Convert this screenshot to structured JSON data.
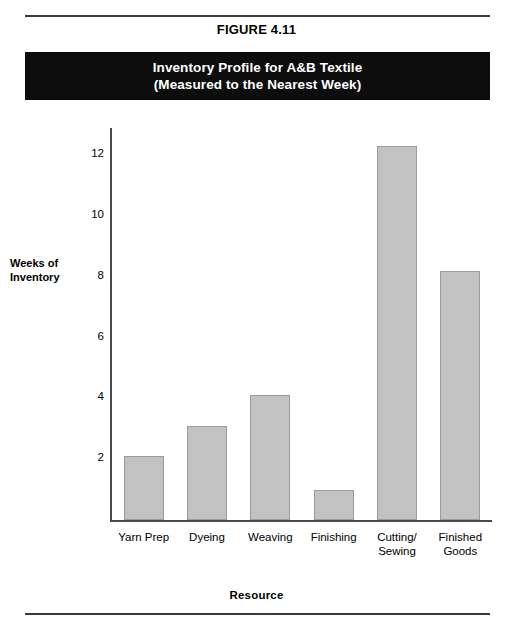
{
  "figure": {
    "number": "FIGURE 4.11",
    "title_line_1": "Inventory Profile for A&B Textile",
    "title_line_2": "(Measured to the Nearest Week)"
  },
  "colors": {
    "bar_fill": "#c2c2c2",
    "bar_stroke": "#9b9b9b",
    "banner_bg": "#0d0d0d",
    "banner_text": "#ffffff",
    "axis": "#4a4a4a",
    "rule": "#3a3a3a"
  },
  "chart_data": {
    "type": "bar",
    "title": "Inventory Profile for A&B Textile (Measured to the Nearest Week)",
    "xlabel": "Resource",
    "ylabel": "Weeks of Inventory",
    "ylabel_line_1": "Weeks of",
    "ylabel_line_2": "Inventory",
    "categories": [
      "Yarn Prep",
      "Dyeing",
      "Weaving",
      "Finishing",
      "Cutting/ Sewing",
      "Finished Goods"
    ],
    "category_lines": [
      [
        "Yarn Prep",
        ""
      ],
      [
        "Dyeing",
        ""
      ],
      [
        "Weaving",
        ""
      ],
      [
        "Finishing",
        ""
      ],
      [
        "Cutting/",
        "Sewing"
      ],
      [
        "Finished",
        "Goods"
      ]
    ],
    "values": [
      2.1,
      3.1,
      4.1,
      1.0,
      12.3,
      8.2
    ],
    "ylim": [
      0,
      12.9
    ],
    "yticks": [
      2,
      4,
      6,
      8,
      10,
      12
    ],
    "ytick_labels": [
      "2",
      "4",
      "6",
      "8",
      "10",
      "12"
    ],
    "grid": false,
    "legend": null
  }
}
